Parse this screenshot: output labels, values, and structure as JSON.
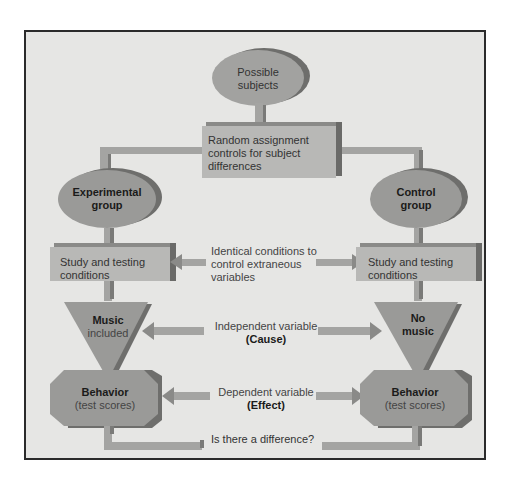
{
  "diagram": {
    "nodes": {
      "possible_subjects": {
        "line1": "Possible",
        "line2": "subjects"
      },
      "random_assignment": {
        "line1": "Random assignment",
        "line2": "controls for subject",
        "line3": "differences"
      },
      "experimental_group": {
        "line1": "Experimental",
        "line2": "group"
      },
      "control_group": {
        "line1": "Control",
        "line2": "group"
      },
      "study_left": {
        "line1": "Study and testing",
        "line2": "conditions"
      },
      "study_right": {
        "line1": "Study and testing",
        "line2": "conditions"
      },
      "music_included": {
        "bold": "Music",
        "normal": "included"
      },
      "no_music": {
        "line1": "No",
        "line2": "music"
      },
      "behavior_left": {
        "bold": "Behavior",
        "normal": "(test scores)"
      },
      "behavior_right": {
        "bold": "Behavior",
        "normal": "(test scores)"
      }
    },
    "annotations": {
      "identical_conditions": {
        "line1": "Identical conditions to",
        "line2": "control extraneous",
        "line3": "variables"
      },
      "independent_variable": {
        "line1": "Independent variable",
        "line2": "(Cause)"
      },
      "dependent_variable": {
        "line1": "Dependent variable",
        "line2": "(Effect)"
      },
      "difference_question": "Is there a difference?"
    },
    "colors": {
      "background": "#e6e6e4",
      "frame": "#2b2b2b",
      "shape_fill": "#9a9a98",
      "shape_shadow": "#6e6e6c",
      "box_fill": "#b8b8b6",
      "arrow_fill": "#a4a4a2"
    }
  }
}
